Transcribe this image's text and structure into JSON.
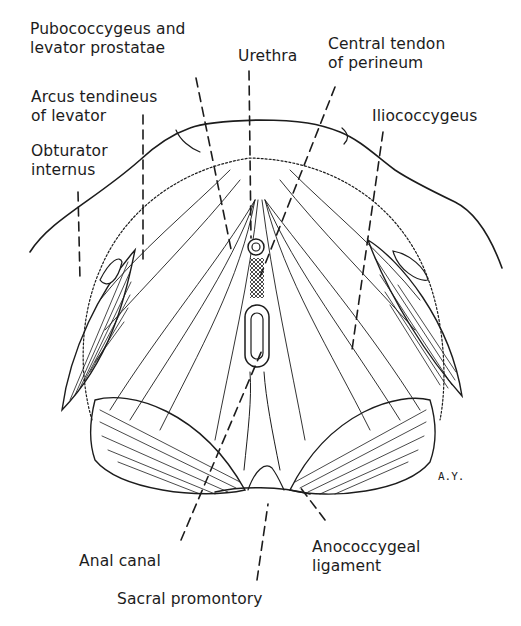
{
  "figure": {
    "colors": {
      "ink": "#1c1c1c",
      "background": "#ffffff"
    },
    "signature": "A.Y.",
    "labels": [
      {
        "id": "pubococcygeus",
        "text": "Pubococcygeus and\nlevator prostatae",
        "x": 30,
        "y": 26
      },
      {
        "id": "urethra",
        "text": "Urethra",
        "x": 238,
        "y": 48
      },
      {
        "id": "central-tendon",
        "text": "Central tendon\nof perineum",
        "x": 328,
        "y": 37
      },
      {
        "id": "arcus-tendineus",
        "text": "Arcus tendineus\nof levator",
        "x": 31,
        "y": 93
      },
      {
        "id": "obturator-internus",
        "text": "Obturator\ninternus",
        "x": 31,
        "y": 145
      },
      {
        "id": "iliococcygeus",
        "text": "Iliococcygeus",
        "x": 372,
        "y": 107
      },
      {
        "id": "anal-canal",
        "text": "Anal canal",
        "x": 79,
        "y": 552
      },
      {
        "id": "anococcygeal-ligament",
        "text": "Anococcygeal\nligament",
        "x": 312,
        "y": 540
      },
      {
        "id": "sacral-promontory",
        "text": "Sacral promontory",
        "x": 117,
        "y": 590
      }
    ]
  }
}
